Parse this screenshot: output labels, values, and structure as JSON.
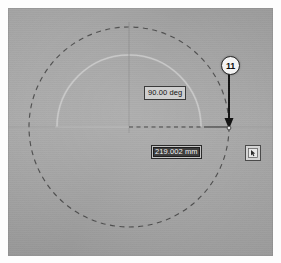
{
  "app": {
    "kind": "cad-sketch-viewport",
    "background_color": "#a8a8a8"
  },
  "viewport": {
    "name": "sketch-canvas"
  },
  "annotations": {
    "angle_dimension": {
      "value": "90.00 deg",
      "name": "angle-dimension-label"
    },
    "linear_dimension": {
      "value": "219.002 mm",
      "placeholder": "219.002 mm",
      "state": "selected",
      "name": "linear-dimension-input"
    },
    "callout": {
      "label": "11",
      "name": "callout-balloon-11"
    },
    "tool_button": {
      "icon": "select-cursor-icon",
      "label": ""
    }
  },
  "geometry": {
    "construction_circle": {
      "name": "construction-circle",
      "cx": 121,
      "cy": 119,
      "r": 100,
      "style": "dashed",
      "color": "#4a4a4a"
    },
    "arc": {
      "name": "profile-arc",
      "cx": 121,
      "cy": 119,
      "r": 72,
      "style": "solid",
      "color": "#c8c8c8"
    },
    "horizontal_centerline": {
      "name": "horizontal-centerline",
      "y": 119,
      "style": "dashed",
      "color": "#3d3d3d"
    },
    "vertical_centerline": {
      "name": "vertical-centerline",
      "x": 121,
      "style": "solid",
      "color": "#8f8f8f"
    },
    "dimension_leader": {
      "name": "dimension-leader-line",
      "y": 119,
      "color": "#4a4a4a"
    },
    "arrow": {
      "name": "callout-leader-arrow",
      "x": 221,
      "y_start": 65,
      "y_end": 118,
      "color": "#151515"
    },
    "endpoint": {
      "name": "dimension-endpoint",
      "x": 221,
      "y": 119
    }
  },
  "colors": {
    "canvas": "#a8a8a8",
    "dim_box_fill": "#cfcfcf",
    "dim_box_border": "#3a3a3a",
    "selection_fill": "#3f3f3f",
    "selection_text": "#f2f2f2",
    "balloon_fill": "#f3f3f3",
    "line_dark": "#3d3d3d",
    "line_light": "#c8c8c8"
  }
}
